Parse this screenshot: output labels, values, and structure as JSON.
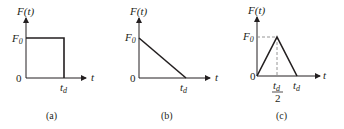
{
  "figure": {
    "panels": [
      {
        "id": "a",
        "caption": "(a)",
        "shape": "rectangular pulse",
        "y_axis_label": "F(t)",
        "x_axis_label": "t",
        "origin_label": "0",
        "amplitude_label": "F",
        "amplitude_sub": "0",
        "duration_label": "t",
        "duration_sub": "d"
      },
      {
        "id": "b",
        "caption": "(b)",
        "shape": "decaying ramp (triangular, peak at t=0)",
        "y_axis_label": "F(t)",
        "x_axis_label": "t",
        "origin_label": "0",
        "amplitude_label": "F",
        "amplitude_sub": "0",
        "duration_label": "t",
        "duration_sub": "d"
      },
      {
        "id": "c",
        "caption": "(c)",
        "shape": "symmetric triangular pulse, peak at t_d/2",
        "y_axis_label": "F(t)",
        "x_axis_label": "t",
        "origin_label": "0",
        "amplitude_label": "F",
        "amplitude_sub": "0",
        "mid_label_num": "t",
        "mid_label_sub": "d",
        "mid_label_den": "2",
        "duration_label": "t",
        "duration_sub": "d"
      }
    ],
    "colors": {
      "ink": "#231f20",
      "dashed": "#8a8a8a",
      "background": "#ffffff"
    }
  }
}
